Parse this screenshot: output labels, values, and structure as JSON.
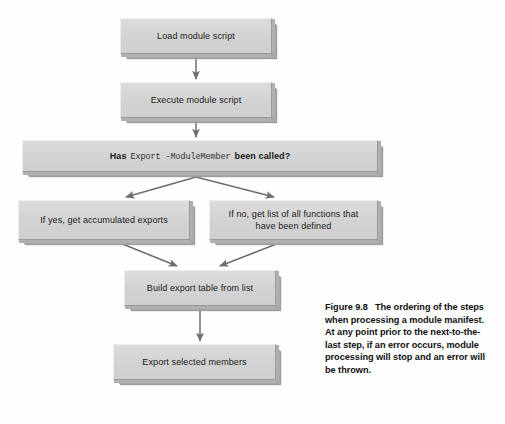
{
  "figure": {
    "number": "Figure 9.8",
    "caption": "The ordering of the steps when processing a module manifest. At any point prior to the next-to-the-last step, if an error occurs, module processing will stop and an error will be thrown."
  },
  "diagram": {
    "type": "flowchart",
    "background_color": "#fefefe",
    "node_fill_color": "#d4d4d4",
    "node_border_color": "#9a9a9a",
    "arrow_color": "#6e6e6e",
    "nodes": [
      {
        "id": "load-module-script",
        "label": "Load module script",
        "x": 120,
        "y": 18,
        "w": 152,
        "h": 36
      },
      {
        "id": "execute-module-script",
        "label": "Execute module script",
        "x": 120,
        "y": 82,
        "w": 152,
        "h": 36
      },
      {
        "id": "has-export-modulemember-been-called",
        "label_prefix": "Has",
        "label_cmdlet": "Export -ModuleMember",
        "label_suffix": "been called?",
        "label": "Has Export -ModuleMember been called?",
        "x": 22,
        "y": 140,
        "w": 356,
        "h": 32
      },
      {
        "id": "if-yes-get-accumulated-exports",
        "label": "If yes, get accumulated exports",
        "x": 18,
        "y": 200,
        "w": 172,
        "h": 40
      },
      {
        "id": "if-no-get-list-of-all-functions",
        "label": "If no, get list of all functions that\nhave been defined",
        "x": 209,
        "y": 200,
        "w": 169,
        "h": 40
      },
      {
        "id": "build-export-table-from-list",
        "label": "Build export table from list",
        "x": 124,
        "y": 270,
        "w": 152,
        "h": 36
      },
      {
        "id": "export-selected-members",
        "label": "Export selected members",
        "x": 113,
        "y": 344,
        "w": 163,
        "h": 36
      }
    ],
    "edges": [
      {
        "id": "edge-load-to-execute",
        "from": "load-module-script",
        "to": "execute-module-script"
      },
      {
        "id": "edge-execute-to-decision",
        "from": "execute-module-script",
        "to": "has-export-modulemember-been-called"
      },
      {
        "id": "edge-decision-to-yes",
        "from": "has-export-modulemember-been-called",
        "to": "if-yes-get-accumulated-exports"
      },
      {
        "id": "edge-decision-to-no",
        "from": "has-export-modulemember-been-called",
        "to": "if-no-get-list-of-all-functions"
      },
      {
        "id": "edge-yes-to-build",
        "from": "if-yes-get-accumulated-exports",
        "to": "build-export-table-from-list"
      },
      {
        "id": "edge-no-to-build",
        "from": "if-no-get-list-of-all-functions",
        "to": "build-export-table-from-list"
      },
      {
        "id": "edge-build-to-export",
        "from": "build-export-table-from-list",
        "to": "export-selected-members"
      }
    ]
  }
}
